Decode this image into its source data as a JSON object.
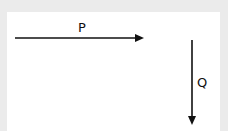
{
  "diagram": {
    "vectors": [
      {
        "label": "P",
        "direction": "right"
      },
      {
        "label": "Q",
        "direction": "down"
      }
    ],
    "colors": {
      "background": "#ebebeb",
      "panel": "#ffffff",
      "stroke": "#111111"
    }
  }
}
